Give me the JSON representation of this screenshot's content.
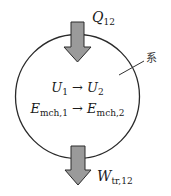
{
  "diagram": {
    "type": "closed system energy balance",
    "system_label": "系",
    "heat_in": {
      "symbol": "Q",
      "subscript": "12"
    },
    "work_out": {
      "symbol": "W",
      "subscript": "tr,12"
    },
    "internal_energy": {
      "from_symbol": "U",
      "from_sub": "1",
      "arrow": "→",
      "to_symbol": "U",
      "to_sub": "2"
    },
    "mechanical_energy": {
      "from_symbol": "E",
      "from_sub": "mch,1",
      "arrow": "→",
      "to_symbol": "E",
      "to_sub": "mch,2"
    },
    "colors": {
      "arrow_fill": "#9a9a9a",
      "arrow_stroke": "#2a2a2a",
      "circle_stroke": "#2a2a2a"
    }
  }
}
